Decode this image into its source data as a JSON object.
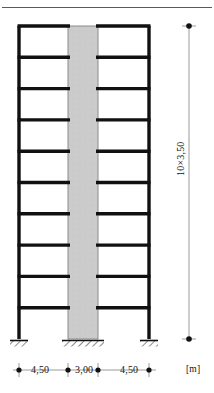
{
  "figure": {
    "type": "structural-elevation",
    "storeys": 10,
    "storey_height": "3,50",
    "unit": "[m]"
  },
  "dimensions": {
    "horizontal": {
      "spans": [
        {
          "label": "4,50",
          "element": "left-bay"
        },
        {
          "label": "3,00",
          "element": "shear-wall"
        },
        {
          "label": "4,50",
          "element": "right-bay"
        }
      ],
      "unit_label": "[m]"
    },
    "vertical": {
      "label": "10×3,50"
    }
  },
  "geometry": {
    "frame": {
      "left_column_x": 19,
      "right_column_x": 149,
      "wall_left_x": 68,
      "wall_right_x": 98,
      "top_y": 26,
      "base_y": 339,
      "storey_count": 10,
      "member_width": 3.4
    },
    "supports": [
      {
        "name": "support-left-column",
        "cx": 19,
        "half_width": 9
      },
      {
        "name": "support-shear-wall",
        "cx": 83,
        "half_width": 21
      },
      {
        "name": "support-right-column",
        "cx": 149,
        "half_width": 9
      }
    ],
    "dim_line_y": 370,
    "dim_ticks_x": [
      19,
      68,
      98,
      149
    ],
    "vertical_dim_x": 189,
    "vertical_dim_top": 26,
    "vertical_dim_bottom": 339
  },
  "colors": {
    "member": "#111111",
    "wall_fill": "#cbcbcb",
    "wall_stroke": "#8c8c8c",
    "hatch": "#2b2b2b",
    "dim_line": "#8e8e8e",
    "dim_marker": "#111111",
    "top_rule": "#5a5a5a",
    "background": "#ffffff"
  }
}
